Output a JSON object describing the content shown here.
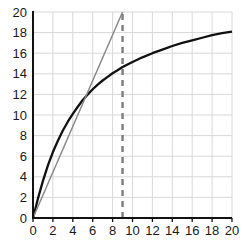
{
  "chart_data": {
    "type": "line",
    "title": "",
    "xlabel": "",
    "ylabel": "",
    "xlim": [
      0,
      20
    ],
    "ylim": [
      0,
      20
    ],
    "grid": true,
    "legend": "none",
    "xticks": [
      0,
      2,
      4,
      6,
      8,
      10,
      12,
      14,
      16,
      18,
      20
    ],
    "yticks": [
      0,
      2,
      4,
      6,
      8,
      10,
      12,
      14,
      16,
      18,
      20
    ],
    "xtick_labels": [
      "0",
      "2",
      "4",
      "6",
      "8",
      "10",
      "12",
      "14",
      "16",
      "18",
      "20"
    ],
    "ytick_labels": [
      "0",
      "2",
      "4",
      "6",
      "8",
      "10",
      "12",
      "14",
      "16",
      "18",
      "20"
    ],
    "series": [
      {
        "name": "concave-curve",
        "style": "solid",
        "color": "#111111",
        "width": 2.3,
        "x": [
          0,
          0.5,
          1,
          1.5,
          2,
          2.5,
          3,
          3.5,
          4,
          4.5,
          5,
          5.5,
          6,
          6.5,
          7,
          7.5,
          8,
          8.5,
          9,
          9.5,
          10,
          11,
          12,
          13,
          14,
          15,
          16,
          17,
          18,
          19,
          20
        ],
        "y": [
          0,
          1.9,
          3.6,
          5.1,
          6.4,
          7.5,
          8.5,
          9.35,
          10.1,
          10.8,
          11.45,
          12.0,
          12.5,
          12.95,
          13.35,
          13.7,
          14.05,
          14.35,
          14.65,
          14.9,
          15.15,
          15.6,
          16.0,
          16.35,
          16.7,
          17.0,
          17.25,
          17.5,
          17.75,
          17.95,
          18.1
        ]
      },
      {
        "name": "tangent-line",
        "style": "solid",
        "color": "#8a8a8a",
        "width": 1.5,
        "x": [
          0,
          9
        ],
        "y": [
          0,
          20
        ]
      },
      {
        "name": "vertical-marker",
        "style": "dashed",
        "color": "#7d7d7d",
        "width": 2.4,
        "x": [
          9,
          9
        ],
        "y": [
          0,
          20
        ]
      },
      {
        "name": "baseline-marker",
        "style": "dashed",
        "color": "#4a4a4a",
        "width": 1.6,
        "x": [
          0,
          20
        ],
        "y": [
          0,
          0
        ]
      }
    ],
    "colors": {
      "grid": "#d8d8d8",
      "axis": "#111111",
      "background": "#ffffff",
      "curve": "#111111",
      "tangent": "#8a8a8a",
      "dashed_marker": "#7d7d7d"
    }
  }
}
